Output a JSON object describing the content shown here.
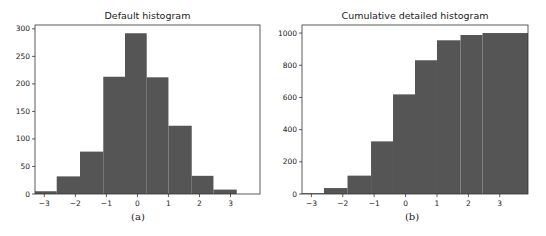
{
  "chart_data": [
    {
      "type": "bar",
      "title": "Default histogram",
      "caption": "(a)",
      "xlabel": "",
      "ylabel": "",
      "bin_edges": [
        -3.3,
        -2.6,
        -1.85,
        -1.1,
        -0.4,
        0.3,
        1.0,
        1.75,
        2.45,
        3.2
      ],
      "values": [
        5,
        32,
        77,
        213,
        292,
        212,
        124,
        33,
        8
      ],
      "xticks": [
        -3,
        -2,
        -1,
        0,
        1,
        2,
        3
      ],
      "yticks": [
        0,
        50,
        100,
        150,
        200,
        250,
        300
      ],
      "xlim": [
        -3.3,
        3.95
      ],
      "ylim": [
        0,
        307
      ],
      "grid": false,
      "color": "#555555"
    },
    {
      "type": "bar",
      "title": "Cumulative detailed histogram",
      "caption": "(b)",
      "xlabel": "",
      "ylabel": "",
      "bin_edges": [
        -3.3,
        -2.6,
        -1.85,
        -1.1,
        -0.4,
        0.3,
        1.0,
        1.75,
        2.45,
        3.9
      ],
      "values": [
        5,
        37,
        114,
        327,
        619,
        831,
        955,
        988,
        1000
      ],
      "xticks": [
        -3,
        -2,
        -1,
        0,
        1,
        2,
        3
      ],
      "yticks": [
        0,
        200,
        400,
        600,
        800,
        1000
      ],
      "xlim": [
        -3.3,
        3.9
      ],
      "ylim": [
        0,
        1050
      ],
      "grid": false,
      "color": "#555555"
    }
  ]
}
